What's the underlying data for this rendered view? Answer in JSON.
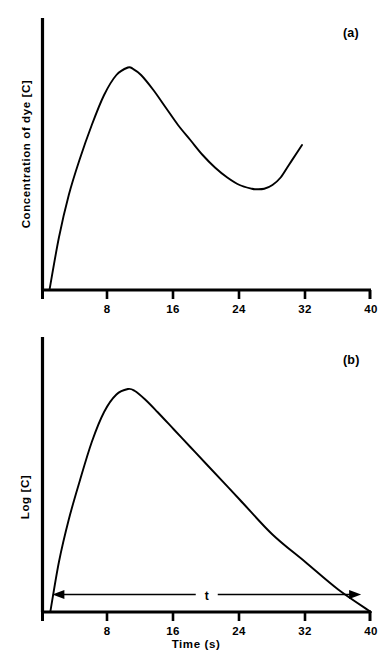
{
  "figure": {
    "background_color": "#ffffff",
    "ink_color": "#000000",
    "panels": [
      {
        "tag": "(a)",
        "ylabel": "Concentration of dye [C]",
        "xlabel": "",
        "xticks": [
          "8",
          "16",
          "24",
          "32",
          "40"
        ]
      },
      {
        "tag": "(b)",
        "ylabel": "Log [C]",
        "xlabel": "Time (s)",
        "xticks": [
          "8",
          "16",
          "24",
          "32",
          "40"
        ],
        "annotation": "t"
      }
    ]
  },
  "chart_data": [
    {
      "type": "line",
      "title": "",
      "panel": "(a)",
      "xlabel": "",
      "ylabel": "Concentration of dye [C]",
      "xlim": [
        0,
        40
      ],
      "ylim": [
        0,
        1
      ],
      "xticks": [
        8,
        16,
        24,
        32,
        40
      ],
      "yticks": [],
      "grid": false,
      "legend": null,
      "series": [
        {
          "name": "Concentration of dye",
          "x": [
            0.85,
            2,
            3.2,
            4.5,
            6,
            7.5,
            9,
            10.4,
            11,
            12,
            13.5,
            15,
            16.5,
            18,
            19.5,
            21,
            22.5,
            24,
            25.5,
            26,
            27,
            28,
            29,
            30,
            31,
            31.6
          ],
          "y": [
            0.0,
            0.21,
            0.38,
            0.52,
            0.66,
            0.78,
            0.86,
            0.89,
            0.885,
            0.86,
            0.8,
            0.73,
            0.66,
            0.6,
            0.54,
            0.49,
            0.45,
            0.42,
            0.405,
            0.403,
            0.405,
            0.42,
            0.45,
            0.5,
            0.55,
            0.58
          ]
        }
      ]
    },
    {
      "type": "line",
      "title": "",
      "panel": "(b)",
      "xlabel": "Time (s)",
      "ylabel": "Log [C]",
      "xlim": [
        0,
        40
      ],
      "ylim": [
        0,
        1
      ],
      "xticks": [
        8,
        16,
        24,
        32,
        40
      ],
      "yticks": [],
      "grid": false,
      "legend": null,
      "annotations": [
        {
          "type": "double-arrow",
          "label": "t",
          "x_start": 1.2,
          "x_end": 38.8,
          "y": 0.07
        }
      ],
      "series": [
        {
          "name": "Log [C]",
          "x": [
            0.95,
            2,
            3.2,
            4.5,
            6,
            7.5,
            9,
            10.4,
            11.2,
            12.5,
            14,
            16,
            18,
            20,
            24,
            28,
            32,
            36,
            40
          ],
          "y": [
            0.0,
            0.2,
            0.37,
            0.52,
            0.68,
            0.8,
            0.87,
            0.892,
            0.885,
            0.85,
            0.8,
            0.73,
            0.66,
            0.59,
            0.45,
            0.31,
            0.2,
            0.09,
            0.0
          ]
        }
      ]
    }
  ]
}
